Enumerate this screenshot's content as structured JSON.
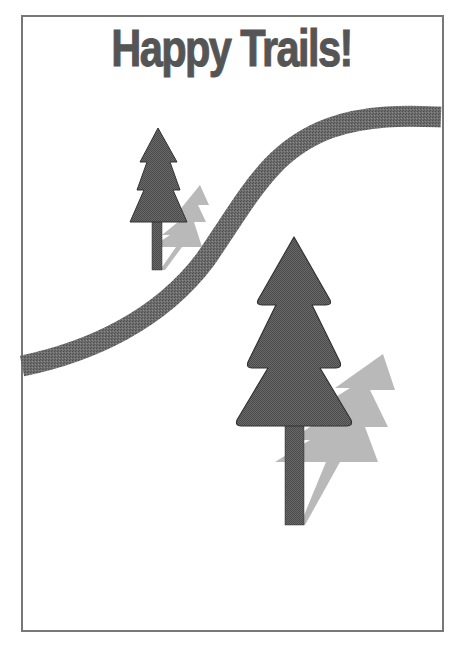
{
  "poster": {
    "title": "Happy Trails!",
    "colors": {
      "background": "#ffffff",
      "frame": "#777777",
      "title": "#555555",
      "tree": "#555555",
      "tree_outline": "#333333",
      "shadow": "#aaaaaa",
      "trail": "#666666"
    }
  },
  "illustration": {
    "elements": [
      {
        "name": "trail",
        "description": "winding grey path from left edge to upper right"
      },
      {
        "name": "small-tree",
        "description": "small pine tree with light shadow"
      },
      {
        "name": "large-tree",
        "description": "large pine tree with light shadow"
      }
    ]
  }
}
